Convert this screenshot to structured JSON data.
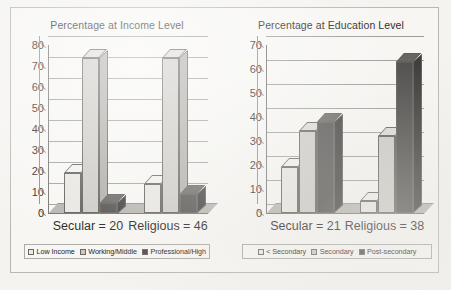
{
  "chart_data": [
    {
      "type": "bar",
      "title": "Percentage at Income Level",
      "xlabel": "",
      "ylabel": "",
      "ylim": [
        0,
        80
      ],
      "yticks": [
        0,
        10,
        20,
        30,
        40,
        50,
        60,
        70,
        80
      ],
      "grid": true,
      "legend_position": "bottom",
      "categories": [
        "Secular = 20",
        "Religious = 46"
      ],
      "series": [
        {
          "name": "Low Income",
          "values": [
            19,
            14
          ],
          "color": "#e7e6e2"
        },
        {
          "name": "Working/Middle",
          "values": [
            74,
            74
          ],
          "color": "#cbcac5"
        },
        {
          "name": "Professional/High",
          "values": [
            5,
            9
          ],
          "color": "#4e4d4b"
        }
      ]
    },
    {
      "type": "bar",
      "title": "Percentage at Education Level",
      "xlabel": "",
      "ylabel": "",
      "ylim": [
        0,
        70
      ],
      "yticks": [
        0,
        10,
        20,
        30,
        40,
        50,
        60,
        70
      ],
      "grid": true,
      "legend_position": "bottom",
      "categories": [
        "Secular = 21",
        "Religious = 38"
      ],
      "series": [
        {
          "name": "< Secondary",
          "values": [
            19,
            5
          ],
          "color": "#e7e6e2"
        },
        {
          "name": "Secondary",
          "values": [
            34,
            32
          ],
          "color": "#cbcac5"
        },
        {
          "name": "Post-secondary",
          "values": [
            38,
            63
          ],
          "color": "#4e4d4b"
        }
      ]
    }
  ]
}
